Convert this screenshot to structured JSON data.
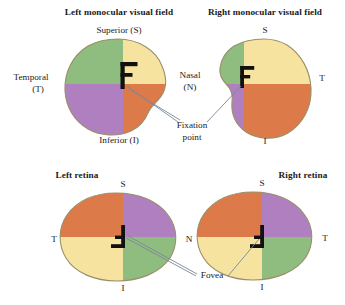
{
  "figure": {
    "title_top_left": "Left monocular visual field",
    "title_top_right": "Right monocular visual field",
    "title_bottom_left": "Left retina",
    "title_bottom_right": "Right retina",
    "labels": {
      "superior_full": "Superior (S)",
      "inferior_full": "Inferior (I)",
      "temporal_full_line1": "Temporal",
      "temporal_full_line2": "(T)",
      "nasal_full_line1": "Nasal",
      "nasal_full_line2": "(N)",
      "s": "S",
      "i": "I",
      "t": "T",
      "n": "N",
      "fixation_line1": "Fixation",
      "fixation_line2": "point",
      "fovea": "Fovea",
      "letter_f": "F"
    },
    "colors": {
      "green": "#8fbc7f",
      "yellow": "#f6e3a0",
      "purple": "#b07fc0",
      "orange": "#dd7a4a",
      "outline": "#9a8f6a",
      "leader": "#7d8796",
      "glyph": "#111111",
      "background": "#ffffff"
    },
    "panels": [
      {
        "name": "left-visual-field",
        "quadrants": [
          {
            "position": "upper-left",
            "color": "green"
          },
          {
            "position": "upper-right",
            "color": "yellow"
          },
          {
            "position": "lower-left",
            "color": "purple"
          },
          {
            "position": "lower-right",
            "color": "orange"
          }
        ],
        "glyph_orientation": "upright",
        "glyph_anchor": "fixation-point"
      },
      {
        "name": "right-visual-field",
        "quadrants": [
          {
            "position": "upper-left",
            "color": "green"
          },
          {
            "position": "upper-right",
            "color": "yellow"
          },
          {
            "position": "lower-left",
            "color": "purple"
          },
          {
            "position": "lower-right",
            "color": "orange"
          }
        ],
        "glyph_orientation": "upright",
        "glyph_anchor": "fixation-point"
      },
      {
        "name": "left-retina",
        "quadrants": [
          {
            "position": "upper-left",
            "color": "orange"
          },
          {
            "position": "upper-right",
            "color": "purple"
          },
          {
            "position": "lower-left",
            "color": "yellow"
          },
          {
            "position": "lower-right",
            "color": "green"
          }
        ],
        "glyph_orientation": "inverted-180",
        "glyph_anchor": "fovea"
      },
      {
        "name": "right-retina",
        "quadrants": [
          {
            "position": "upper-left",
            "color": "orange"
          },
          {
            "position": "upper-right",
            "color": "purple"
          },
          {
            "position": "lower-left",
            "color": "yellow"
          },
          {
            "position": "lower-right",
            "color": "green"
          }
        ],
        "glyph_orientation": "inverted-180",
        "glyph_anchor": "fovea"
      }
    ]
  }
}
